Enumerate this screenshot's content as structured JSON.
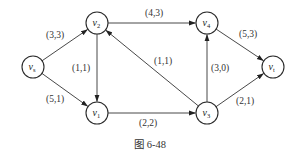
{
  "figure": {
    "caption": "图 6-48",
    "stroke_color": "#333333",
    "background": "#ffffff"
  },
  "nodes": [
    {
      "id": "vs",
      "base": "v",
      "sub": "s",
      "x": 33,
      "y": 67
    },
    {
      "id": "v2",
      "base": "v",
      "sub": "2",
      "x": 97,
      "y": 23
    },
    {
      "id": "v1",
      "base": "v",
      "sub": "1",
      "x": 97,
      "y": 113
    },
    {
      "id": "v4",
      "base": "v",
      "sub": "4",
      "x": 207,
      "y": 23
    },
    {
      "id": "v3",
      "base": "v",
      "sub": "3",
      "x": 207,
      "y": 113
    },
    {
      "id": "vt",
      "base": "v",
      "sub": "t",
      "x": 273,
      "y": 67
    }
  ],
  "edges": [
    {
      "from": "vs",
      "to": "v2",
      "label": "(3,3)",
      "lx": 46,
      "ly": 38
    },
    {
      "from": "vs",
      "to": "v1",
      "label": "(5,1)",
      "lx": 46,
      "ly": 102
    },
    {
      "from": "v2",
      "to": "v1",
      "label": "(1,1)",
      "lx": 72,
      "ly": 71
    },
    {
      "from": "v2",
      "to": "v4",
      "label": "(4,3)",
      "lx": 145,
      "ly": 16
    },
    {
      "from": "v3",
      "to": "v2",
      "label": "(1,1)",
      "lx": 154,
      "ly": 64
    },
    {
      "from": "v1",
      "to": "v3",
      "label": "(2,2)",
      "lx": 139,
      "ly": 126
    },
    {
      "from": "v3",
      "to": "v4",
      "label": "(3,0)",
      "lx": 211,
      "ly": 71
    },
    {
      "from": "v4",
      "to": "vt",
      "label": "(5,3)",
      "lx": 239,
      "ly": 37
    },
    {
      "from": "v3",
      "to": "vt",
      "label": "(2,1)",
      "lx": 236,
      "ly": 104
    }
  ],
  "node_radius": 11
}
